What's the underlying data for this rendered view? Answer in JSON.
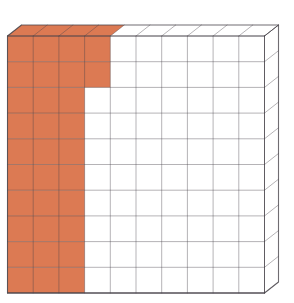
{
  "page": {
    "background_color": "#ffffff"
  },
  "diagram": {
    "type": "hundred-grid-base-ten-flat",
    "grid": {
      "rows": 10,
      "columns": 10,
      "total_cells": 100
    },
    "shaded": {
      "count": 32,
      "represents": 0.32,
      "color": "#dc7a53",
      "cells_per_row": [
        4,
        4,
        3,
        3,
        3,
        3,
        3,
        3,
        3,
        3
      ]
    },
    "unshaded": {
      "count": 68,
      "color": "#ffffff"
    },
    "lines": {
      "grid_color": "rgba(72,68,74,0.45)",
      "outline_color": "rgba(72,68,74,0.78)"
    }
  }
}
